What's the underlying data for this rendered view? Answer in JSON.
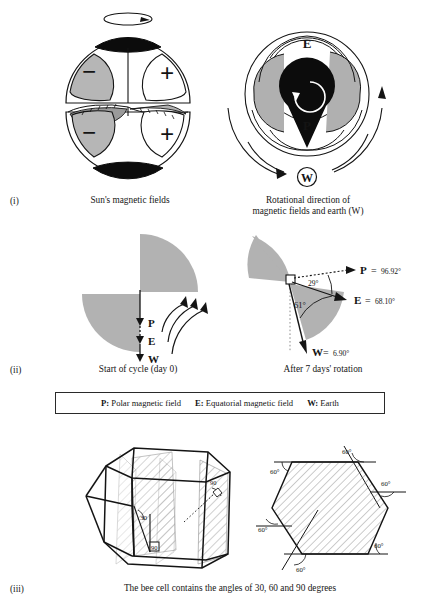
{
  "figure": {
    "panels": [
      {
        "index_label": "(i)",
        "captions": [
          "Sun's magnetic fields",
          "Rotational direction of\nmagnetic fields and earth (W)"
        ],
        "sun_diagram": {
          "polarity_labels": [
            "−",
            "+",
            "−",
            "+"
          ],
          "spin_arrow": "rotation-arrow"
        },
        "rotation_diagram": {
          "labels": [
            "E",
            "P",
            "W"
          ]
        }
      },
      {
        "index_label": "(ii)",
        "captions": [
          "Start of cycle (day 0)",
          "After 7 days' rotation"
        ],
        "start_of_cycle": {
          "vector_labels": [
            "P",
            "E",
            "W"
          ]
        },
        "after_rotation": {
          "vectors": [
            {
              "name": "P",
              "equals": "=",
              "value": "96.92°"
            },
            {
              "name": "E",
              "equals": "=",
              "value": "68.10°"
            },
            {
              "name": "W",
              "equals": "=",
              "value": "6.90°"
            }
          ],
          "interior_angles": [
            "29°",
            "61°"
          ]
        }
      },
      {
        "index_label": "(iii)",
        "captions": [
          "The bee cell contains the angles of 30, 60 and 90 degrees"
        ],
        "cell_3d": {
          "angle_labels": [
            "30",
            "90",
            "90"
          ]
        },
        "hexagon": {
          "angle_labels": [
            "60°",
            "60°",
            "60°",
            "60°",
            "60°",
            "60°"
          ]
        }
      }
    ],
    "legend": {
      "items": [
        {
          "key": "P:",
          "text": " Polar magnetic field"
        },
        {
          "key": "E:",
          "text": " Equatorial magnetic field"
        },
        {
          "key": "W:",
          "text": " Earth"
        }
      ]
    },
    "colors": {
      "ink": "#141414",
      "gray_fill": "#b2b2b2",
      "gray_fill_dark": "#9a9a9a",
      "black_fill": "#0c0c0c",
      "paper": "#ffffff"
    }
  }
}
